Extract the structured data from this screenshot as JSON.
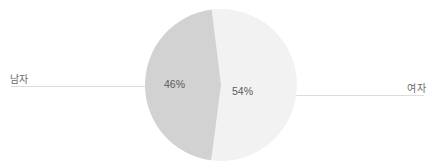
{
  "chart_data": {
    "type": "pie",
    "title": "",
    "categories": [
      "남자",
      "여자"
    ],
    "values": [
      46,
      54
    ],
    "value_labels": [
      "46%",
      "54%"
    ],
    "unit": "%",
    "colors": [
      "#d2d2d2",
      "#f2f2f2"
    ],
    "legend": "none",
    "grid": false,
    "annotations": {
      "leader_lines": true
    },
    "slices": [
      {
        "label": "남자",
        "value": 46,
        "value_label": "46%",
        "color": "#d2d2d2",
        "label_side": "left"
      },
      {
        "label": "여자",
        "value": 54,
        "value_label": "54%",
        "color": "#f2f2f2",
        "label_side": "right"
      }
    ]
  },
  "chart": {
    "left_category_label": "남자",
    "right_category_label": "여자",
    "left_value_label": "46%",
    "right_value_label": "54%",
    "leader_line_color": "#dcdcdc"
  }
}
